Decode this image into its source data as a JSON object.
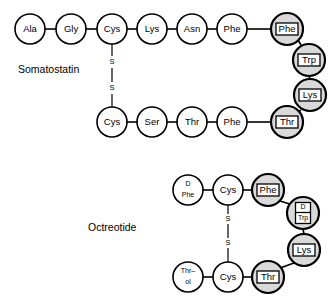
{
  "figure": {
    "background_color": "#ffffff",
    "line_color": "#000000",
    "shaded_fill": "#d9d9d9",
    "plain_fill": "#ffffff"
  },
  "peptides": [
    {
      "id": "somatostatin",
      "name": "Somatostatin",
      "name_x": 18,
      "name_y": 70,
      "residues": [
        {
          "id": "sst-ala",
          "label": "Ala",
          "label2": "",
          "cx": 30,
          "cy": 29,
          "r": 15,
          "boxed": false,
          "shaded": false
        },
        {
          "id": "sst-gly",
          "label": "Gly",
          "label2": "",
          "cx": 71,
          "cy": 29,
          "r": 15,
          "boxed": false,
          "shaded": false
        },
        {
          "id": "sst-cys1",
          "label": "Cys",
          "label2": "",
          "cx": 112,
          "cy": 29,
          "r": 15,
          "boxed": false,
          "shaded": false
        },
        {
          "id": "sst-lys1",
          "label": "Lys",
          "label2": "",
          "cx": 152,
          "cy": 29,
          "r": 15,
          "boxed": false,
          "shaded": false
        },
        {
          "id": "sst-asn",
          "label": "Asn",
          "label2": "",
          "cx": 192,
          "cy": 29,
          "r": 15,
          "boxed": false,
          "shaded": false
        },
        {
          "id": "sst-phe1",
          "label": "Phe",
          "label2": "",
          "cx": 232,
          "cy": 29,
          "r": 15,
          "boxed": false,
          "shaded": false
        },
        {
          "id": "sst-phe2",
          "label": "Phe",
          "label2": "",
          "cx": 287,
          "cy": 29,
          "r": 16,
          "boxed": true,
          "shaded": true
        },
        {
          "id": "sst-trp",
          "label": "Trp",
          "label2": "",
          "cx": 309,
          "cy": 60,
          "r": 16,
          "boxed": true,
          "shaded": true
        },
        {
          "id": "sst-lys2",
          "label": "Lys",
          "label2": "",
          "cx": 310,
          "cy": 95,
          "r": 16,
          "boxed": true,
          "shaded": true
        },
        {
          "id": "sst-thr2",
          "label": "Thr",
          "label2": "",
          "cx": 287,
          "cy": 122,
          "r": 16,
          "boxed": true,
          "shaded": true
        },
        {
          "id": "sst-phe3",
          "label": "Phe",
          "label2": "",
          "cx": 232,
          "cy": 122,
          "r": 15,
          "boxed": false,
          "shaded": false
        },
        {
          "id": "sst-thr1",
          "label": "Thr",
          "label2": "",
          "cx": 192,
          "cy": 122,
          "r": 15,
          "boxed": false,
          "shaded": false
        },
        {
          "id": "sst-ser",
          "label": "Ser",
          "label2": "",
          "cx": 152,
          "cy": 122,
          "r": 15,
          "boxed": false,
          "shaded": false
        },
        {
          "id": "sst-cys2",
          "label": "Cys",
          "label2": "",
          "cx": 112,
          "cy": 122,
          "r": 15,
          "boxed": false,
          "shaded": false
        }
      ],
      "bonds": [
        {
          "x1": 45,
          "y1": 29,
          "x2": 56,
          "y2": 29
        },
        {
          "x1": 86,
          "y1": 29,
          "x2": 97,
          "y2": 29
        },
        {
          "x1": 127,
          "y1": 29,
          "x2": 137,
          "y2": 29
        },
        {
          "x1": 167,
          "y1": 29,
          "x2": 177,
          "y2": 29
        },
        {
          "x1": 207,
          "y1": 29,
          "x2": 217,
          "y2": 29
        },
        {
          "x1": 247,
          "y1": 29,
          "x2": 271,
          "y2": 29
        },
        {
          "x1": 298,
          "y1": 40,
          "x2": 301,
          "y2": 45
        },
        {
          "x1": 309,
          "y1": 76,
          "x2": 310,
          "y2": 79
        },
        {
          "x1": 301,
          "y1": 110,
          "x2": 297,
          "y2": 113
        },
        {
          "x1": 247,
          "y1": 122,
          "x2": 271,
          "y2": 122
        },
        {
          "x1": 207,
          "y1": 122,
          "x2": 217,
          "y2": 122
        },
        {
          "x1": 167,
          "y1": 122,
          "x2": 177,
          "y2": 122
        },
        {
          "x1": 127,
          "y1": 122,
          "x2": 137,
          "y2": 122
        }
      ],
      "disulfide": {
        "id": "sst-disulfide",
        "segments": [
          {
            "x1": 112,
            "y1": 44,
            "x2": 112,
            "y2": 56
          },
          {
            "x1": 112,
            "y1": 68,
            "x2": 112,
            "y2": 82
          },
          {
            "x1": 112,
            "y1": 94,
            "x2": 112,
            "y2": 107
          }
        ],
        "labels": [
          {
            "text": "S",
            "x": 112,
            "y": 62
          },
          {
            "text": "S",
            "x": 112,
            "y": 88
          }
        ]
      }
    },
    {
      "id": "octreotide",
      "name": "Octreotide",
      "name_x": 88,
      "name_y": 228,
      "residues": [
        {
          "id": "oct-dphe",
          "label": "D",
          "label2": "Phe",
          "cx": 188,
          "cy": 190,
          "r": 15,
          "boxed": false,
          "shaded": false
        },
        {
          "id": "oct-cys1",
          "label": "Cys",
          "label2": "",
          "cx": 228,
          "cy": 190,
          "r": 15,
          "boxed": false,
          "shaded": false
        },
        {
          "id": "oct-phe",
          "label": "Phe",
          "label2": "",
          "cx": 268,
          "cy": 190,
          "r": 16,
          "boxed": true,
          "shaded": true
        },
        {
          "id": "oct-dtrp",
          "label": "D",
          "label2": "Trp",
          "cx": 303,
          "cy": 213,
          "r": 16,
          "boxed": true,
          "shaded": true
        },
        {
          "id": "oct-lys",
          "label": "Lys",
          "label2": "",
          "cx": 304,
          "cy": 250,
          "r": 16,
          "boxed": true,
          "shaded": true
        },
        {
          "id": "oct-thr2",
          "label": "Thr",
          "label2": "",
          "cx": 268,
          "cy": 277,
          "r": 16,
          "boxed": true,
          "shaded": true
        },
        {
          "id": "oct-cys2",
          "label": "Cys",
          "label2": "",
          "cx": 228,
          "cy": 277,
          "r": 15,
          "boxed": false,
          "shaded": false
        },
        {
          "id": "oct-throl",
          "label": "Thr–",
          "label2": "ol",
          "cx": 188,
          "cy": 277,
          "r": 15,
          "boxed": false,
          "shaded": false
        }
      ],
      "bonds": [
        {
          "x1": 203,
          "y1": 190,
          "x2": 213,
          "y2": 190
        },
        {
          "x1": 243,
          "y1": 190,
          "x2": 252,
          "y2": 190
        },
        {
          "x1": 280,
          "y1": 201,
          "x2": 293,
          "y2": 205
        },
        {
          "x1": 303,
          "y1": 229,
          "x2": 304,
          "y2": 234
        },
        {
          "x1": 294,
          "y1": 263,
          "x2": 280,
          "y2": 268
        },
        {
          "x1": 243,
          "y1": 277,
          "x2": 252,
          "y2": 277
        },
        {
          "x1": 203,
          "y1": 277,
          "x2": 213,
          "y2": 277
        }
      ],
      "disulfide": {
        "id": "oct-disulfide",
        "segments": [
          {
            "x1": 228,
            "y1": 205,
            "x2": 228,
            "y2": 214
          },
          {
            "x1": 228,
            "y1": 224,
            "x2": 228,
            "y2": 238
          },
          {
            "x1": 228,
            "y1": 248,
            "x2": 228,
            "y2": 262
          }
        ],
        "labels": [
          {
            "text": "S",
            "x": 228,
            "y": 219
          },
          {
            "text": "S",
            "x": 228,
            "y": 243
          }
        ]
      }
    }
  ]
}
